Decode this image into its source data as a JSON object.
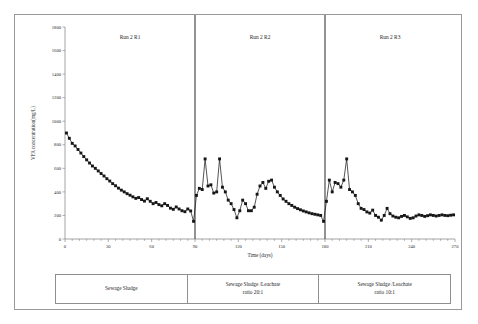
{
  "figure": {
    "panel_labels": [
      "Run 2 R1",
      "Run 2 R2",
      "Run 2 R3"
    ],
    "legend_cells": [
      {
        "line1": "Sewage Sludge",
        "line2": ""
      },
      {
        "line1": "Sewage Sludge /Leachate",
        "line2": "ratio 20:1"
      },
      {
        "line1": "Sewage Sludge /Leachate",
        "line2": "ratio 10:1"
      }
    ]
  },
  "chart_data": {
    "type": "line",
    "title": "",
    "xlabel": "Time (days)",
    "ylabel": "VFA concentration(mg/L)",
    "xlim": [
      0,
      270
    ],
    "ylim": [
      0,
      1800
    ],
    "xticks": [
      0,
      30,
      60,
      90,
      120,
      150,
      180,
      210,
      240,
      270
    ],
    "yticks": [
      0,
      200,
      400,
      600,
      800,
      1000,
      1200,
      1400,
      1600,
      1800
    ],
    "grid": false,
    "legend_position": "none",
    "marker": "square",
    "annotations": [
      {
        "text": "Run 2 R1",
        "x": 45,
        "y": 1700
      },
      {
        "text": "Run 2 R2",
        "x": 135,
        "y": 1700
      },
      {
        "text": "Run 2 R3",
        "x": 225,
        "y": 1700
      }
    ],
    "vertical_dividers": [
      90,
      180
    ],
    "series": [
      {
        "name": "VFA concentration",
        "x": [
          1,
          3,
          5,
          7,
          9,
          11,
          13,
          15,
          17,
          19,
          21,
          23,
          25,
          27,
          29,
          31,
          33,
          35,
          37,
          39,
          41,
          43,
          45,
          47,
          49,
          51,
          53,
          55,
          57,
          59,
          61,
          63,
          65,
          67,
          69,
          71,
          73,
          75,
          77,
          79,
          81,
          83,
          85,
          87,
          89,
          91,
          93,
          95,
          97,
          99,
          101,
          103,
          105,
          107,
          109,
          111,
          113,
          115,
          117,
          119,
          121,
          123,
          125,
          127,
          129,
          131,
          133,
          135,
          137,
          139,
          141,
          143,
          145,
          147,
          149,
          151,
          153,
          155,
          157,
          159,
          161,
          163,
          165,
          167,
          169,
          171,
          173,
          175,
          177,
          179,
          181,
          183,
          185,
          187,
          189,
          191,
          193,
          195,
          197,
          199,
          201,
          203,
          205,
          207,
          209,
          211,
          213,
          215,
          217,
          219,
          221,
          223,
          225,
          227,
          229,
          231,
          233,
          235,
          237,
          239,
          241,
          243,
          245,
          247,
          249,
          251,
          253,
          255,
          257,
          259,
          261,
          263,
          265,
          267,
          269
        ],
        "y": [
          900,
          880,
          855,
          830,
          810,
          800,
          775,
          760,
          735,
          720,
          700,
          690,
          665,
          650,
          630,
          615,
          600,
          585,
          570,
          555,
          545,
          530,
          515,
          500,
          485,
          470,
          455,
          440,
          420,
          400,
          385,
          390,
          370,
          355,
          360,
          340,
          330,
          320,
          300,
          295,
          280,
          265,
          260,
          250,
          150,
          305,
          310,
          320,
          330,
          320,
          300,
          365,
          375,
          360,
          340,
          330,
          350,
          360,
          345,
          330,
          300,
          290,
          280,
          295,
          330,
          400,
          430,
          450,
          470,
          475,
          450,
          430,
          415,
          395,
          380,
          360,
          345,
          330,
          320,
          305,
          295,
          285,
          275,
          265,
          255,
          245,
          240,
          230,
          225,
          150,
          300,
          460,
          470,
          440,
          420,
          450,
          475,
          500,
          490,
          470,
          440,
          410,
          380,
          345,
          320,
          300,
          280,
          260,
          245,
          235,
          225,
          215,
          210,
          205,
          200,
          195,
          190,
          185,
          182,
          180,
          178,
          180,
          185,
          190,
          195,
          200,
          205,
          200,
          195,
          190,
          188,
          190,
          195,
          198,
          200
        ]
      },
      {
        "name": "VFA concentration (detail)",
        "x": [
          2,
          4,
          6,
          8,
          10,
          12,
          14,
          16,
          18,
          20,
          22,
          24,
          26,
          28,
          30,
          32,
          34,
          36,
          38,
          40,
          42,
          44,
          46,
          48,
          50,
          52,
          54,
          56,
          58,
          60,
          62,
          64,
          66,
          68,
          70,
          72,
          74,
          76,
          78,
          80,
          82,
          84,
          86,
          88,
          90
        ],
        "y": [
          890,
          868,
          842,
          820,
          805,
          788,
          768,
          748,
          728,
          710,
          695,
          678,
          658,
          640,
          622,
          608,
          592,
          578,
          562,
          550,
          538,
          522,
          508,
          492,
          478,
          462,
          448,
          430,
          410,
          392,
          388,
          380,
          362,
          358,
          350,
          335,
          325,
          310,
          298,
          288,
          272,
          262,
          255,
          200,
          240
        ]
      }
    ],
    "plotted_points": {
      "note": "single square-marker series; x in days, y in mg/L",
      "x": [
        1,
        3,
        5,
        7,
        9,
        11,
        13,
        15,
        17,
        19,
        21,
        23,
        25,
        27,
        29,
        31,
        33,
        35,
        37,
        39,
        41,
        43,
        45,
        47,
        49,
        51,
        53,
        55,
        57,
        59,
        61,
        63,
        65,
        67,
        69,
        71,
        73,
        75,
        77,
        79,
        81,
        83,
        85,
        87,
        89,
        91,
        93,
        95,
        97,
        99,
        101,
        103,
        105,
        107,
        109,
        111,
        113,
        115,
        117,
        119,
        121,
        123,
        125,
        127,
        129,
        131,
        133,
        135,
        137,
        139,
        141,
        143,
        145,
        147,
        149,
        151,
        153,
        155,
        157,
        159,
        161,
        163,
        165,
        167,
        169,
        171,
        173,
        175,
        177,
        179,
        181,
        183,
        185,
        187,
        189,
        191,
        193,
        195,
        197,
        199,
        201,
        203,
        205,
        207,
        209,
        211,
        213,
        215,
        217,
        219,
        221,
        223,
        225,
        227,
        229,
        231,
        233,
        235,
        237,
        239,
        241,
        243,
        245,
        247,
        249,
        251,
        253,
        255,
        257,
        259,
        261,
        263,
        265,
        267,
        269
      ],
      "y": [
        900,
        855,
        812,
        790,
        760,
        730,
        700,
        672,
        645,
        620,
        600,
        578,
        556,
        535,
        512,
        492,
        470,
        452,
        432,
        415,
        400,
        385,
        372,
        358,
        345,
        352,
        335,
        322,
        342,
        320,
        300,
        310,
        292,
        282,
        300,
        285,
        262,
        252,
        272,
        255,
        240,
        232,
        255,
        238,
        150,
        370,
        430,
        420,
        680,
        450,
        460,
        390,
        400,
        680,
        440,
        400,
        330,
        300,
        250,
        180,
        240,
        330,
        300,
        240,
        240,
        270,
        380,
        450,
        480,
        430,
        490,
        500,
        440,
        400,
        370,
        340,
        320,
        300,
        285,
        270,
        258,
        248,
        238,
        230,
        222,
        215,
        210,
        205,
        200,
        150,
        320,
        500,
        400,
        480,
        470,
        440,
        500,
        680,
        420,
        400,
        370,
        300,
        260,
        250,
        230,
        220,
        245,
        200,
        185,
        160,
        200,
        260,
        215,
        195,
        185,
        180,
        192,
        200,
        188,
        175,
        180,
        195,
        205,
        200,
        192,
        198,
        205,
        200,
        195,
        200,
        205,
        200,
        198,
        202,
        205
      ]
    }
  }
}
